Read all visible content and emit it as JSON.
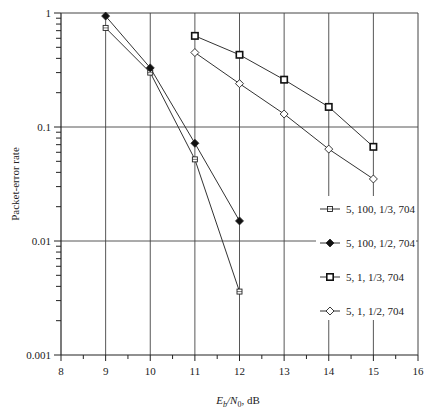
{
  "chart_data": {
    "type": "line",
    "title": "",
    "xlabel": "E_b/N_0, dB",
    "xlabel_parts": {
      "E": "E",
      "b": "b",
      "slash": "/N",
      "zero": "0",
      "unit": ", dB"
    },
    "ylabel": "Packet-error rate",
    "xlim": [
      8,
      16
    ],
    "ylim": [
      0.001,
      1
    ],
    "yscale": "log",
    "grid": true,
    "x_ticks": [
      8,
      9,
      10,
      11,
      12,
      13,
      14,
      15,
      16
    ],
    "x_tick_labels": [
      "8",
      "9",
      "10",
      "11",
      "12",
      "13",
      "14",
      "15",
      "16"
    ],
    "y_ticks": [
      0.001,
      0.01,
      0.1,
      1
    ],
    "y_tick_labels": [
      "0.001",
      "0.01",
      "0.1",
      "1"
    ],
    "legend_position": "right-center inside",
    "series": [
      {
        "name": "5, 100, 1/3, 704",
        "marker": "small-square",
        "x": [
          9,
          10,
          11,
          12
        ],
        "values": [
          0.74,
          0.3,
          0.052,
          0.0036
        ]
      },
      {
        "name": "5, 100, 1/2, 704",
        "marker": "filled-diamond",
        "x": [
          9,
          10,
          11,
          12
        ],
        "values": [
          0.94,
          0.33,
          0.072,
          0.015
        ]
      },
      {
        "name": "5, 1, 1/3, 704",
        "marker": "open-square",
        "x": [
          11,
          12,
          13,
          14,
          15
        ],
        "values": [
          0.63,
          0.43,
          0.26,
          0.15,
          0.067
        ]
      },
      {
        "name": "5, 1, 1/2, 704",
        "marker": "open-diamond",
        "x": [
          11,
          12,
          13,
          14,
          15
        ],
        "values": [
          0.45,
          0.24,
          0.13,
          0.064,
          0.035
        ]
      }
    ]
  },
  "colors": {
    "line": "#333333",
    "grid": "#444444",
    "marker_fill_open": "#ffffff",
    "marker_fill_solid": "#111111"
  }
}
